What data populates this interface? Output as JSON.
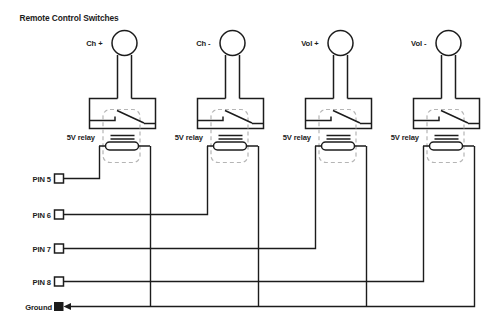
{
  "title": "Remote Control Switches",
  "switches": [
    {
      "label": "Ch +",
      "relay_label": "5V relay"
    },
    {
      "label": "Ch -",
      "relay_label": "5V relay"
    },
    {
      "label": "Vol +",
      "relay_label": "5V relay"
    },
    {
      "label": "Vol -",
      "relay_label": "5V relay"
    }
  ],
  "pins": [
    {
      "label": "PIN 5"
    },
    {
      "label": "PIN 6"
    },
    {
      "label": "PIN 7"
    },
    {
      "label": "PIN 8"
    }
  ],
  "ground_label": "Ground",
  "colors": {
    "wire": "#1c1c1c",
    "relay_outline": "#b5b5b5",
    "background": "#ffffff"
  }
}
